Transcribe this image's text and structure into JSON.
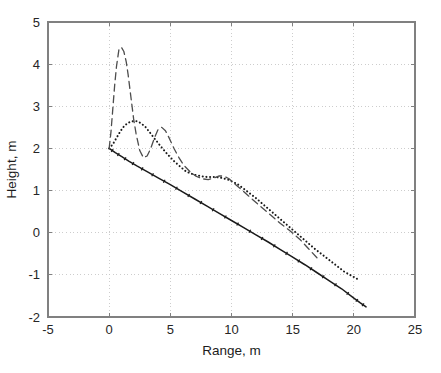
{
  "chart_data": {
    "type": "line",
    "title": "",
    "xlabel": "Range, m",
    "ylabel": "Height, m",
    "xlim": [
      -5,
      25
    ],
    "ylim": [
      -2,
      5
    ],
    "xticks": [
      -5,
      0,
      5,
      10,
      15,
      20,
      25
    ],
    "yticks": [
      -2,
      -1,
      0,
      1,
      2,
      3,
      4,
      5
    ],
    "xticklabels": [
      "-5",
      "0",
      "5",
      "10",
      "15",
      "20",
      "25"
    ],
    "yticklabels": [
      "-2",
      "-1",
      "0",
      "1",
      "2",
      "3",
      "4",
      "5"
    ],
    "grid": true,
    "grid_style": "dotted",
    "grid_color": "#c8c8c8",
    "axis_color": "#808080",
    "legend": null,
    "legend_position": "none",
    "background": "#ffffff",
    "series": [
      {
        "name": "solid-trajectory",
        "style": "solid",
        "color": "#1a1a1a",
        "marker": "tick",
        "x": [
          0,
          0.5,
          1,
          1.6,
          2.3,
          3.1,
          4,
          5,
          6,
          7,
          8,
          9,
          10,
          11,
          12,
          13,
          14,
          15,
          16,
          17,
          18,
          19,
          20,
          20.5,
          21
        ],
        "y": [
          2.0,
          1.9,
          1.81,
          1.7,
          1.58,
          1.45,
          1.3,
          1.14,
          0.97,
          0.8,
          0.63,
          0.46,
          0.29,
          0.12,
          -0.05,
          -0.22,
          -0.4,
          -0.58,
          -0.76,
          -0.95,
          -1.14,
          -1.33,
          -1.55,
          -1.66,
          -1.76
        ]
      },
      {
        "name": "dotted-trajectory",
        "style": "dotted",
        "color": "#1a1a1a",
        "marker": "dot",
        "x": [
          0,
          0.3,
          0.6,
          0.9,
          1.2,
          1.5,
          1.8,
          2.2,
          2.6,
          3.0,
          3.4,
          3.8,
          4.3,
          4.8,
          5.3,
          5.8,
          6.3,
          6.9,
          7.5,
          8.1,
          8.7,
          9.2,
          9.8,
          10.5,
          11.2,
          12.0,
          12.8,
          13.6,
          14.4,
          15.2,
          16.0,
          16.8,
          17.6,
          18.4,
          19.2,
          19.8,
          20.3
        ],
        "y": [
          2.0,
          2.1,
          2.25,
          2.4,
          2.52,
          2.6,
          2.64,
          2.65,
          2.6,
          2.5,
          2.35,
          2.2,
          2.02,
          1.85,
          1.7,
          1.57,
          1.45,
          1.38,
          1.34,
          1.32,
          1.32,
          1.3,
          1.25,
          1.15,
          1.0,
          0.82,
          0.62,
          0.42,
          0.22,
          0.02,
          -0.18,
          -0.38,
          -0.56,
          -0.74,
          -0.92,
          -1.02,
          -1.1
        ]
      },
      {
        "name": "dashed-trajectory",
        "style": "dashed",
        "color": "#4d4d4d",
        "marker": "none",
        "x": [
          0,
          0.15,
          0.3,
          0.45,
          0.6,
          0.8,
          1.0,
          1.2,
          1.4,
          1.55,
          1.7,
          1.85,
          2.0,
          2.2,
          2.5,
          2.8,
          3.1,
          3.4,
          3.7,
          4.0,
          4.3,
          4.6,
          4.9,
          5.3,
          5.7,
          6.1,
          6.6,
          7.1,
          7.6,
          8.1,
          8.6,
          9.0,
          9.4,
          9.8,
          10.3,
          10.9,
          11.6,
          12.4,
          13.2,
          14.0,
          14.8,
          15.6,
          16.3,
          17.0
        ],
        "y": [
          2.0,
          2.4,
          2.95,
          3.5,
          3.95,
          4.35,
          4.4,
          4.3,
          4.05,
          3.75,
          3.4,
          3.05,
          2.7,
          2.35,
          1.95,
          1.78,
          1.82,
          2.0,
          2.25,
          2.45,
          2.5,
          2.42,
          2.25,
          2.0,
          1.78,
          1.6,
          1.45,
          1.34,
          1.28,
          1.26,
          1.3,
          1.35,
          1.34,
          1.28,
          1.15,
          1.0,
          0.82,
          0.62,
          0.42,
          0.22,
          0.04,
          -0.16,
          -0.38,
          -0.6
        ]
      }
    ]
  }
}
